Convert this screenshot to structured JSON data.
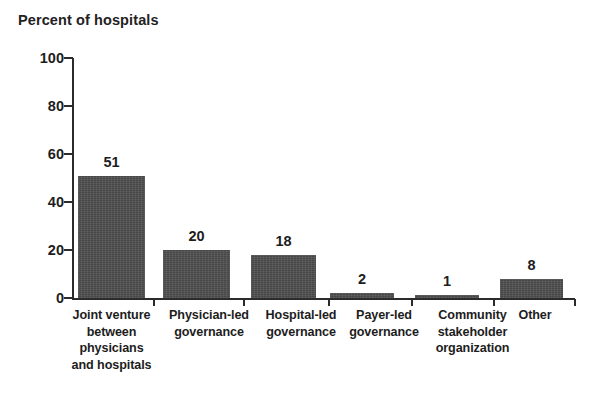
{
  "chart_data": {
    "type": "bar",
    "title": "Percent of hospitals",
    "xlabel": "",
    "ylabel": "",
    "ylim": [
      0,
      100
    ],
    "yticks": [
      0,
      20,
      40,
      60,
      80,
      100
    ],
    "grid": false,
    "legend": null,
    "orientation": "vertical",
    "bar_color": "#4e4e4e",
    "categories": [
      "Joint venture between physicians and hospitals",
      "Physician-led governance",
      "Hospital-led governance",
      "Payer-led governance",
      "Community stakeholder organization",
      "Other"
    ],
    "category_lines": [
      [
        "Joint venture",
        "between",
        "physicians",
        "and hospitals"
      ],
      [
        "Physician-led",
        "governance"
      ],
      [
        "Hospital-led",
        "governance"
      ],
      [
        "Payer-led",
        "governance"
      ],
      [
        "Community",
        "stakeholder",
        "organization"
      ],
      [
        "Other"
      ]
    ],
    "values": [
      51,
      20,
      18,
      2,
      1,
      8
    ],
    "value_labels": [
      "51",
      "20",
      "18",
      "2",
      "1",
      "8"
    ]
  },
  "axis": {
    "y_tick_labels": [
      "100",
      "80",
      "60",
      "40",
      "20",
      "0"
    ],
    "y_tick_values": [
      100,
      80,
      60,
      40,
      20,
      0
    ]
  }
}
